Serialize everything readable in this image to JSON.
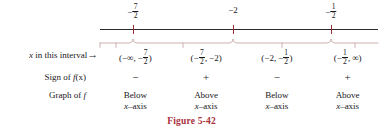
{
  "figure": {
    "caption": "Figure 5-42",
    "caption_color": "#a8313c",
    "axis_color": "#2b2b2f",
    "tick_color": "#9d2b35",
    "brace_color": "#c9a7a7"
  },
  "numberline": {
    "boundary_points": [
      {
        "label_html": "-7/2",
        "numerator": "7",
        "denominator": "2",
        "sign": "−",
        "x_pct": 11.9
      },
      {
        "label_html": "-2",
        "plain": "−2",
        "x_pct": 47.8
      },
      {
        "label_html": "-1/2",
        "numerator": "1",
        "denominator": "2",
        "sign": "−",
        "x_pct": 83.1
      }
    ]
  },
  "rows": {
    "interval": {
      "label": "x in this interval",
      "arrow": "→",
      "cells": [
        {
          "open": "(",
          "left": "−∞",
          "comma": ",",
          "right_sign": "−",
          "right_num": "7",
          "right_den": "2",
          "close": ")"
        },
        {
          "open": "(",
          "left_sign": "−",
          "left_num": "7",
          "left_den": "2",
          "comma": ",",
          "right_plain": "−2",
          "close": ")"
        },
        {
          "open": "(",
          "left_plain": "−2",
          "comma": ",",
          "right_sign": "−",
          "right_num": "1",
          "right_den": "2",
          "close": ")"
        },
        {
          "open": "(",
          "left_sign": "−",
          "left_num": "1",
          "left_den": "2",
          "comma": ",",
          "right_plain": "∞",
          "close": ")"
        }
      ]
    },
    "sign": {
      "label_prefix": "Sign of ",
      "label_fn": "f",
      "label_suffix": "(x)",
      "values": [
        "−",
        "+",
        "−",
        "+"
      ]
    },
    "graph": {
      "label_prefix": "Graph of ",
      "label_fn": "f",
      "values": [
        {
          "line1": "Below",
          "line2_x": "x",
          "line2_rest": "–axis"
        },
        {
          "line1": "Above",
          "line2_x": "x",
          "line2_rest": "–axis"
        },
        {
          "line1": "Below",
          "line2_x": "x",
          "line2_rest": "–axis"
        },
        {
          "line1": "Above",
          "line2_x": "x",
          "line2_rest": "–axis"
        }
      ]
    }
  }
}
